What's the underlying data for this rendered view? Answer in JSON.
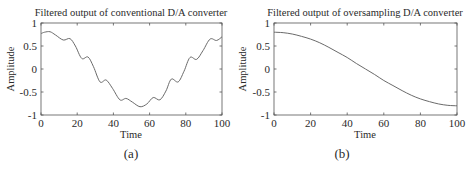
{
  "chart_data": [
    {
      "id": "a",
      "type": "line",
      "title": "Filtered output of conventional D/A converter",
      "xlabel": "Time",
      "ylabel": "Amplitude",
      "caption": "(a)",
      "xlim": [
        0,
        100
      ],
      "ylim": [
        -1,
        1
      ],
      "xticks": [
        0,
        20,
        40,
        60,
        80,
        100
      ],
      "yticks": [
        1,
        0.5,
        0,
        -0.5,
        -1
      ],
      "ytick_labels": [
        "1",
        "0.5",
        "0",
        "-0.5",
        "-1"
      ],
      "grid": false,
      "line_color": "#6a6a6a",
      "series": [
        {
          "name": "filtered conventional D/A output",
          "x": [
            0,
            2,
            5,
            8,
            12.3,
            16,
            19,
            22.5,
            26,
            29,
            32.6,
            36,
            39.5,
            43.6,
            47,
            50.5,
            54.7,
            58.5,
            62,
            65.7,
            69,
            72,
            75.8,
            79,
            82.3,
            86,
            89.5,
            93.4,
            97,
            100
          ],
          "y": [
            0.77,
            0.8,
            0.81,
            0.74,
            0.63,
            0.66,
            0.5,
            0.23,
            0.26,
            0.05,
            -0.28,
            -0.24,
            -0.42,
            -0.67,
            -0.64,
            -0.72,
            -0.82,
            -0.76,
            -0.62,
            -0.67,
            -0.48,
            -0.22,
            -0.28,
            -0.05,
            0.25,
            0.21,
            0.4,
            0.65,
            0.62,
            0.7
          ]
        }
      ]
    },
    {
      "id": "b",
      "type": "line",
      "title": "Filtered output of oversampling D/A converter",
      "xlabel": "Time",
      "ylabel": "Amplitude",
      "caption": "(b)",
      "xlim": [
        0,
        100
      ],
      "ylim": [
        -1,
        1
      ],
      "xticks": [
        0,
        20,
        40,
        60,
        80,
        100
      ],
      "yticks": [
        1,
        0.5,
        0,
        -0.5,
        -1
      ],
      "ytick_labels": [
        "1",
        "0.5",
        "0",
        "-0.5",
        "-1"
      ],
      "grid": false,
      "line_color": "#6a6a6a",
      "series": [
        {
          "name": "filtered oversampling D/A output",
          "x": [
            0,
            5,
            10,
            15,
            20,
            25,
            30,
            35,
            40,
            45,
            50,
            55,
            60,
            65,
            70,
            75,
            80,
            85,
            90,
            95,
            100
          ],
          "y": [
            0.8,
            0.79,
            0.76,
            0.71,
            0.65,
            0.57,
            0.47,
            0.36,
            0.25,
            0.12,
            0.0,
            -0.12,
            -0.25,
            -0.36,
            -0.47,
            -0.57,
            -0.65,
            -0.71,
            -0.76,
            -0.79,
            -0.8
          ]
        }
      ]
    }
  ]
}
